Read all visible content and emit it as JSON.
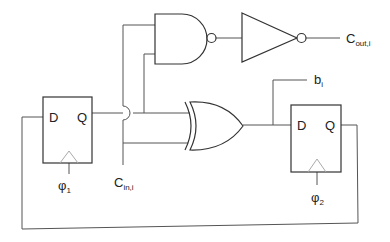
{
  "diagram": {
    "type": "sequential-logic-circuit",
    "components": {
      "ff1": {
        "type": "d-flip-flop",
        "d_label": "D",
        "q_label": "Q",
        "clock": {
          "symbol": "φ",
          "sub": "1"
        }
      },
      "ff2": {
        "type": "d-flip-flop",
        "d_label": "D",
        "q_label": "Q",
        "clock": {
          "symbol": "φ",
          "sub": "2"
        }
      },
      "nand": {
        "type": "nand-gate"
      },
      "inverter": {
        "type": "inverter"
      },
      "xor": {
        "type": "xor-gate"
      }
    },
    "signals": {
      "cin": {
        "main": "C",
        "sub": "in,i"
      },
      "cout": {
        "main": "C",
        "sub": "out,i"
      },
      "b": {
        "main": "b",
        "sub": "i"
      }
    }
  },
  "colors": {
    "wire": "#555555",
    "gate": "#333333",
    "clock_triangle": "#aaaaaa"
  }
}
